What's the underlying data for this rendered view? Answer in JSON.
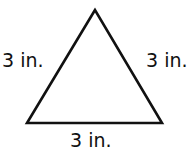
{
  "diagram": {
    "shape": "equilateral-triangle",
    "stroke_color": "#111111",
    "fill_color": "#ffffff",
    "vertices": {
      "apex": [
        95,
        10
      ],
      "bottom_left": [
        27,
        123
      ],
      "bottom_right": [
        162,
        123
      ]
    },
    "side_labels": {
      "left": "3 in.",
      "right": "3 in.",
      "bottom": "3 in."
    }
  }
}
